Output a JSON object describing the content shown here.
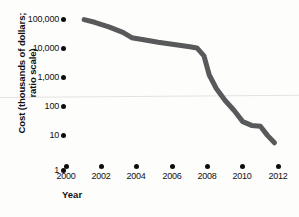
{
  "chart_data": {
    "type": "line",
    "title": "",
    "xlabel": "Year",
    "ylabel": "Cost (thousands of dollars; ratio scale)",
    "ylabel_lines": [
      "Cost (thousands of dollars;",
      "ratio scale)"
    ],
    "scale": "log",
    "grid": false,
    "legend": "none",
    "xlim": [
      2000,
      2012
    ],
    "ylim": [
      1,
      100000
    ],
    "xticks": [
      2000,
      2002,
      2004,
      2006,
      2008,
      2010,
      2012
    ],
    "xtick_labels": [
      "2000",
      "2002",
      "2004",
      "2006",
      "2008",
      "2010",
      "2012"
    ],
    "yticks": [
      1,
      10,
      100,
      1000,
      10000,
      100000
    ],
    "ytick_labels": [
      "1",
      "10",
      "100",
      "1,000",
      "10,000",
      "100,000"
    ],
    "series": [
      {
        "name": "Cost",
        "color": "#58595b",
        "x": [
          2001.0,
          2001.6,
          2002.4,
          2003.2,
          2003.7,
          2004.3,
          2005.2,
          2006.2,
          2007.0,
          2007.4,
          2007.8,
          2008.1,
          2008.5,
          2009.0,
          2009.5,
          2010.0,
          2010.5,
          2011.0,
          2011.4,
          2011.8
        ],
        "y": [
          95000,
          78000,
          55000,
          36000,
          24000,
          21000,
          17000,
          14000,
          12000,
          11000,
          6000,
          1400,
          500,
          200,
          95,
          40,
          30,
          28,
          14,
          8
        ]
      }
    ]
  },
  "axis": {
    "y_ticks": [
      {
        "label": "100,000",
        "value": 100000
      },
      {
        "label": "10,000",
        "value": 10000
      },
      {
        "label": "1,000",
        "value": 1000
      },
      {
        "label": "100",
        "value": 100
      },
      {
        "label": "10",
        "value": 10
      },
      {
        "label": "1",
        "value": 1
      }
    ],
    "x_ticks": [
      {
        "label": "2000"
      },
      {
        "label": "2002"
      },
      {
        "label": "2004"
      },
      {
        "label": "2006"
      },
      {
        "label": "2008"
      },
      {
        "label": "2010"
      },
      {
        "label": "2012"
      }
    ]
  },
  "colors": {
    "line": "#58595b",
    "tick_dot": "#0d0d0d",
    "text": "#111111",
    "background": "#fdfdfc",
    "artifact": "#e2e2e0"
  }
}
